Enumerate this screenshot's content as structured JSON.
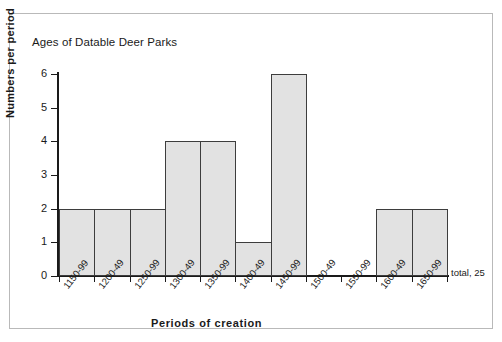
{
  "chart_data": {
    "type": "bar",
    "title": "Ages of Datable Deer Parks",
    "xlabel": "Periods of creation",
    "ylabel": "Numbers per period",
    "categories": [
      "1150-99",
      "1200-49",
      "1250-99",
      "1300-49",
      "1350-99",
      "1400-49",
      "1450-99",
      "1500-49",
      "1550-99",
      "1600-49",
      "1650-99"
    ],
    "values": [
      2,
      2,
      2,
      4,
      4,
      1,
      6,
      0,
      0,
      2,
      2
    ],
    "ylim": [
      0,
      6
    ],
    "ytick_labels": [
      "0",
      "1",
      "2",
      "3",
      "4",
      "5",
      "6"
    ],
    "ytick_values": [
      0,
      1,
      2,
      3,
      4,
      5,
      6
    ],
    "grid": false,
    "legend": false,
    "annotation": "total, 25",
    "bar_fill_color": "#e2e2e2",
    "bar_edge_color": "#3d3d3d",
    "axis_color": "#1a1a1a",
    "frame_color": "#b9b9b9",
    "histogram_contiguous": true
  }
}
